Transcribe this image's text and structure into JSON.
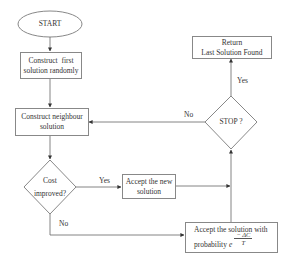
{
  "diagram": {
    "type": "flowchart",
    "title": "",
    "nodes": {
      "start": {
        "label": "START",
        "shape": "ellipse"
      },
      "construct_first": {
        "line1": "Construct  first",
        "line2": "solution randomly",
        "shape": "rectangle"
      },
      "construct_neighbour": {
        "line1": "Construct neighbour",
        "line2": "solution",
        "shape": "rectangle"
      },
      "cost_improved": {
        "line1": "Cost",
        "line2": "improved?",
        "shape": "diamond"
      },
      "accept_new": {
        "line1": "Accept the new",
        "line2": "solution",
        "shape": "rectangle"
      },
      "accept_prob": {
        "line1": "Accept the solution with",
        "line2": "probability",
        "base": "e",
        "exponent_num": "− ΔC",
        "exponent_den": "T",
        "shape": "rectangle"
      },
      "stop": {
        "label": "STOP ?",
        "shape": "diamond"
      },
      "return": {
        "line1": "Return",
        "line2": "Last Solution Found",
        "shape": "rectangle"
      }
    },
    "edges": [
      {
        "from": "start",
        "to": "construct_first",
        "label": ""
      },
      {
        "from": "construct_first",
        "to": "construct_neighbour",
        "label": ""
      },
      {
        "from": "construct_neighbour",
        "to": "cost_improved",
        "label": ""
      },
      {
        "from": "cost_improved",
        "to": "accept_new",
        "label": "Yes"
      },
      {
        "from": "cost_improved",
        "to": "accept_prob",
        "label": "No"
      },
      {
        "from": "accept_new",
        "to": "stop",
        "label": ""
      },
      {
        "from": "accept_prob",
        "to": "stop",
        "label": ""
      },
      {
        "from": "stop",
        "to": "return",
        "label": "Yes"
      },
      {
        "from": "stop",
        "to": "construct_neighbour",
        "label": "No"
      }
    ],
    "edge_labels": {
      "cost_yes": "Yes",
      "cost_no": "No",
      "stop_yes": "Yes",
      "stop_no": "No"
    },
    "colors": {
      "line": "#666666",
      "border": "#888888",
      "text": "#333333",
      "background": "#ffffff"
    }
  }
}
